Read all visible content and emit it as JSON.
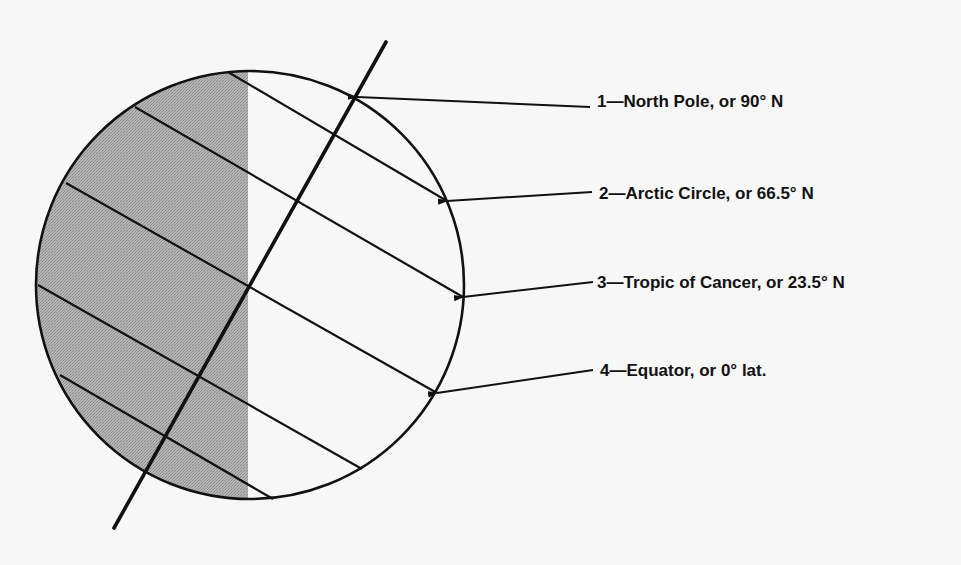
{
  "diagram": {
    "type": "earth-latitude-diagram",
    "colors": {
      "background": "#f7f7f7",
      "ink": "#111111",
      "shade": "#a9a9a9"
    },
    "globe": {
      "cx": 250,
      "cy": 285,
      "r": 214,
      "shade_edge_x": 248
    },
    "axis": {
      "x1": 386,
      "y1": 42,
      "x2": 114,
      "y2": 528
    },
    "latitude_lines": [
      {
        "x1": 228,
        "y1": 72,
        "x2": 447,
        "y2": 201
      },
      {
        "x1": 135,
        "y1": 107,
        "x2": 463,
        "y2": 297
      },
      {
        "x1": 66,
        "y1": 183,
        "x2": 437,
        "y2": 393
      },
      {
        "x1": 38,
        "y1": 285,
        "x2": 362,
        "y2": 469
      },
      {
        "x1": 60,
        "y1": 375,
        "x2": 273,
        "y2": 499
      }
    ],
    "callouts": [
      {
        "number": "1",
        "text": "1—North Pole, or 90° N",
        "tip": [
          357,
          97
        ],
        "tail": [
          590,
          107
        ],
        "label_x": 597,
        "label_y": 92
      },
      {
        "number": "2",
        "text": "2—Arctic Circle, or 66.5° N",
        "tip": [
          447,
          201
        ],
        "tail": [
          592,
          192
        ],
        "label_x": 599,
        "label_y": 184
      },
      {
        "number": "3",
        "text": "3—Tropic of Cancer, or 23.5° N",
        "tip": [
          463,
          297
        ],
        "tail": [
          593,
          282
        ],
        "label_x": 597,
        "label_y": 273
      },
      {
        "number": "4",
        "text": "4—Equator, or 0° lat.",
        "tip": [
          437,
          393
        ],
        "tail": [
          593,
          370
        ],
        "label_x": 600,
        "label_y": 361
      }
    ]
  }
}
